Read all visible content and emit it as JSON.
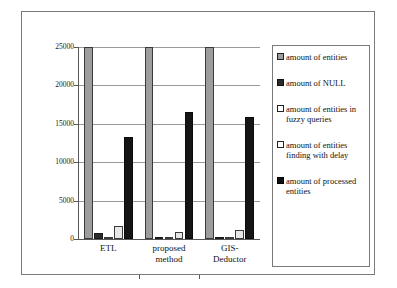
{
  "chart_data": {
    "type": "bar",
    "title": "",
    "xlabel": "",
    "ylabel": "",
    "ylim": [
      0,
      25000
    ],
    "yticks": [
      0,
      5000,
      10000,
      15000,
      20000,
      25000
    ],
    "ytick_labels": [
      "0",
      "5000",
      "10000",
      "15000",
      "20000",
      "25000"
    ],
    "grid": true,
    "legend_position": "right",
    "categories": [
      "ETL",
      "proposed method",
      "GIS-Deductor"
    ],
    "category_lines": [
      [
        "ETL"
      ],
      [
        "proposed",
        "method"
      ],
      [
        "GIS-",
        "Deductor"
      ]
    ],
    "series": [
      {
        "name": "amount of entities",
        "values": [
          25000,
          25000,
          25000
        ],
        "color": "#9d9d9d"
      },
      {
        "name": "amount of NULL",
        "values": [
          800,
          100,
          250
        ],
        "color": "#2a2a2a"
      },
      {
        "name": "amount of entities in fuzzy queries",
        "values": [
          300,
          60,
          60
        ],
        "color": "#fbfbfb"
      },
      {
        "name": "amount of entities finding with delay",
        "values": [
          1700,
          900,
          1200
        ],
        "color": "#e7e7e7"
      },
      {
        "name": "amount of processed entities",
        "values": [
          13300,
          16500,
          15900
        ],
        "color": "#151515"
      }
    ]
  },
  "legend": {
    "entries": [
      {
        "label": "amount of entities",
        "swatch": "legend-swatch-entities"
      },
      {
        "label": "amount of NULL",
        "swatch": "legend-swatch-null"
      },
      {
        "label": "amount of entities in fuzzy queries",
        "swatch": "legend-swatch-fuzzy"
      },
      {
        "label": "amount of entities finding with delay",
        "swatch": "legend-swatch-delay"
      },
      {
        "label": "amount of processed entities",
        "swatch": "legend-swatch-processed"
      }
    ]
  },
  "axis": {
    "y_labels": [
      "25000",
      "20000",
      "15000",
      "10000",
      "5000",
      "0"
    ]
  }
}
